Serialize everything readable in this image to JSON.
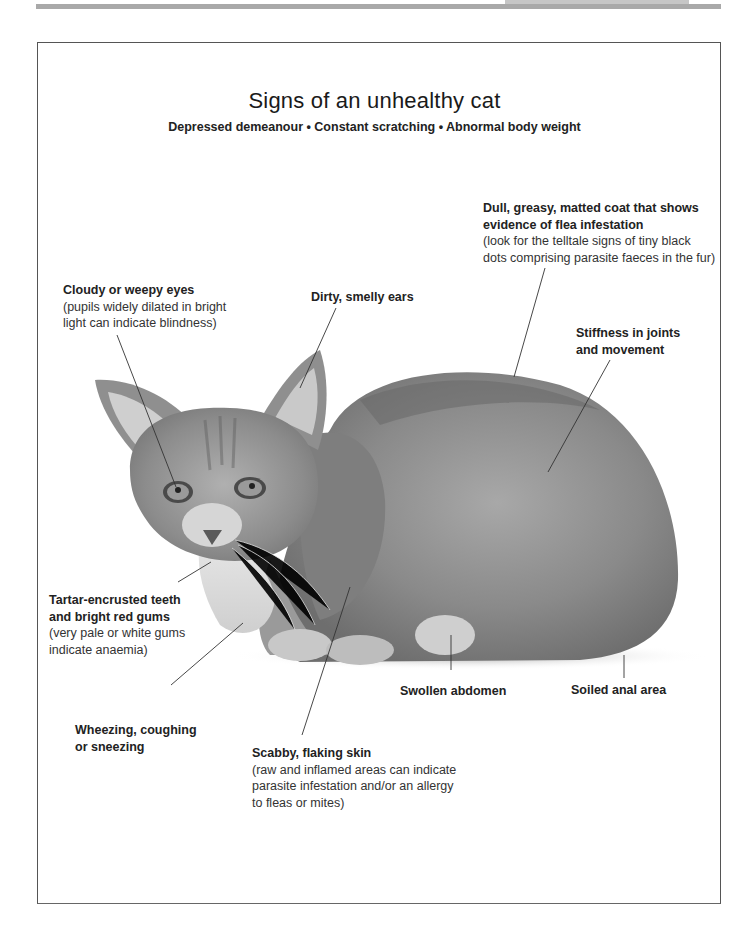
{
  "page": {
    "title": "Signs of an unhealthy cat",
    "subtitle": "Depressed demeanour • Constant scratching • Abnormal body weight"
  },
  "image": {
    "subject": "grey tabby kitten crouching",
    "icon": "cat-photo"
  },
  "callouts": [
    {
      "id": "coat",
      "head": "Dull, greasy, matted coat that shows evidence of flea infestation",
      "head_lines": [
        "Dull, greasy, matted coat that shows",
        "evidence of flea infestation"
      ],
      "note_lines": [
        "(look for the telltale signs of tiny black",
        "dots comprising parasite faeces in the fur)"
      ]
    },
    {
      "id": "eyes",
      "head_lines": [
        "Cloudy or weepy eyes"
      ],
      "note_lines": [
        "(pupils widely dilated in bright",
        "light can indicate blindness)"
      ]
    },
    {
      "id": "ears",
      "head_lines": [
        "Dirty, smelly ears"
      ],
      "note_lines": []
    },
    {
      "id": "joints",
      "head_lines": [
        "Stiffness in joints",
        "and movement"
      ],
      "note_lines": []
    },
    {
      "id": "teeth",
      "head_lines": [
        "Tartar-encrusted teeth",
        "and bright red gums"
      ],
      "note_lines": [
        "(very pale or white gums",
        "indicate anaemia)"
      ]
    },
    {
      "id": "abdomen",
      "head_lines": [
        "Swollen abdomen"
      ],
      "note_lines": []
    },
    {
      "id": "anal",
      "head_lines": [
        "Soiled anal area"
      ],
      "note_lines": []
    },
    {
      "id": "breathing",
      "head_lines": [
        "Wheezing, coughing",
        "or sneezing"
      ],
      "note_lines": []
    },
    {
      "id": "skin",
      "head_lines": [
        "Scabby, flaking skin"
      ],
      "note_lines": [
        "(raw and inflamed areas can indicate",
        "parasite infestation and/or an allergy",
        "to fleas or mites)"
      ]
    }
  ],
  "colors": {
    "text": "#1a1a1a",
    "rule": "#a9a9a9",
    "frame": "#555555",
    "cat_dark": "#6b6b6b",
    "cat_light": "#bdbdbd"
  }
}
